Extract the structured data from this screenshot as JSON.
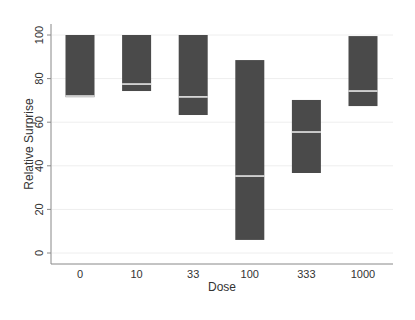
{
  "chart_data": {
    "type": "box",
    "title": "",
    "xlabel": "Dose",
    "ylabel": "Relative Surprise",
    "categories": [
      "0",
      "10",
      "33",
      "100",
      "333",
      "1000"
    ],
    "boxes": [
      {
        "category": "0",
        "upper": 100,
        "median": 72,
        "lower": 71.5
      },
      {
        "category": "10",
        "upper": 100,
        "median": 77.5,
        "lower": 74.3
      },
      {
        "category": "33",
        "upper": 100,
        "median": 71.6,
        "lower": 63.3
      },
      {
        "category": "100",
        "upper": 88.5,
        "median": 35.3,
        "lower": 6
      },
      {
        "category": "333",
        "upper": 70.2,
        "median": 55.5,
        "lower": 36.7
      },
      {
        "category": "1000",
        "upper": 99.5,
        "median": 74.3,
        "lower": 67.4
      }
    ],
    "yticks": [
      0,
      20,
      40,
      60,
      80,
      100
    ],
    "ylim": [
      -5,
      105
    ],
    "grid": true,
    "legend": null,
    "colors": {
      "box": "#4a4a4a",
      "median": "#f2f2f2",
      "axis": "#888888",
      "grid": "#eeeeee"
    }
  }
}
